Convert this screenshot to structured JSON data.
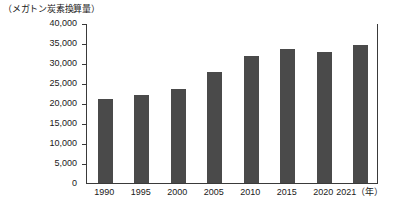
{
  "unit_caption": "（メガトン炭素換算量）",
  "chart_data": {
    "type": "bar",
    "title": "",
    "subtitle": "",
    "xlabel": "年",
    "ylabel": "メガトン炭素換算量",
    "categories": [
      "1990",
      "1995",
      "2000",
      "2005",
      "2010",
      "2015",
      "2020",
      "2021"
    ],
    "x_tick_labels": [
      "1990",
      "1995",
      "2000",
      "2005",
      "2010",
      "2015",
      "2020",
      "2021（年）"
    ],
    "values": [
      20900,
      21900,
      23600,
      27800,
      31700,
      33400,
      32800,
      34500
    ],
    "ylim": [
      0,
      40000
    ],
    "y_tick_values": [
      0,
      5000,
      10000,
      15000,
      20000,
      25000,
      30000,
      35000,
      40000
    ],
    "y_tick_labels": [
      "0",
      "5,000",
      "10,000",
      "15,000",
      "20,000",
      "25,000",
      "30,000",
      "35,000",
      "40,000"
    ],
    "grid": false,
    "legend": null,
    "legend_position": "none",
    "bar_color": "#4a4a4a",
    "axis_color": "#3a3a3a",
    "background_color": "#ffffff",
    "series": [
      {
        "name": "温室効果ガス排出量",
        "values": [
          20900,
          21900,
          23600,
          27800,
          31700,
          33400,
          32800,
          34500
        ]
      }
    ]
  }
}
